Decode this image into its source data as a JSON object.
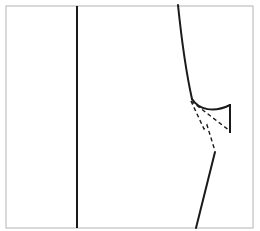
{
  "figure": {
    "type": "line-drawing",
    "width": 260,
    "height": 231,
    "background_color": "#ffffff",
    "stroke_color": "#1a1a1a",
    "border_color": "#b4b4b4",
    "border_width": 1
  },
  "frame": {
    "name": "drawing-border",
    "x": 6,
    "y": 6,
    "width": 247,
    "height": 222,
    "color": "#b4b4b4",
    "width_px": 1
  },
  "elements": [
    {
      "id": "vertical-axis-line",
      "label": "Vertical reference line",
      "style": "solid",
      "stroke_width": 2,
      "color": "#1a1a1a",
      "path": "M 77 6 L 77 228"
    },
    {
      "id": "descending-profile-curve",
      "label": "Steep descending profile curve",
      "style": "solid",
      "stroke_width": 2,
      "color": "#1a1a1a",
      "path": "M 178 5 C 181 34 186 72 192 99"
    },
    {
      "id": "lower-hook-curve",
      "label": "Curved hook to right edge",
      "style": "solid",
      "stroke_width": 2,
      "color": "#1a1a1a",
      "path": "M 192 99 C 199 110 214 113 230 105"
    },
    {
      "id": "right-end-tick",
      "label": "Vertical end tick at right terminus",
      "style": "solid",
      "stroke_width": 2,
      "color": "#1a1a1a",
      "path": "M 230 104 L 230 133"
    },
    {
      "id": "dashed-construction-upper",
      "label": "Dashed construction line to right tick",
      "style": "dashed",
      "stroke_width": 1.4,
      "dash_pattern": "4 3",
      "color": "#1a1a1a",
      "path": "M 191 101 L 230 131"
    },
    {
      "id": "dashed-construction-lower",
      "label": "Dashed construction line descending to junction",
      "style": "dashed",
      "stroke_width": 1.4,
      "dash_pattern": "4 3",
      "color": "#1a1a1a",
      "path": "M 191 101 L 204 129 L 207 125 L 215 151"
    },
    {
      "id": "lower-diagonal-line",
      "label": "Solid diagonal line to bottom edge",
      "style": "solid",
      "stroke_width": 2,
      "color": "#1a1a1a",
      "path": "M 215 152 L 196 228"
    }
  ]
}
